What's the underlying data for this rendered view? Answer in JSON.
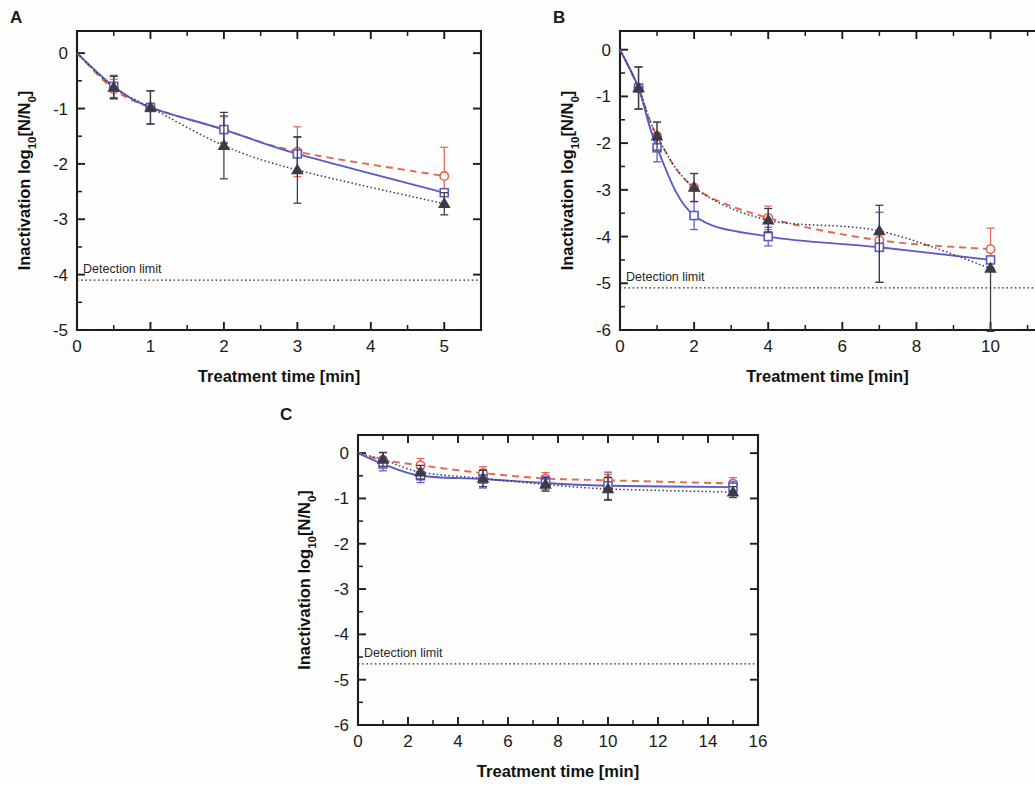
{
  "figure": {
    "background": "#fefefe",
    "axis_color": "#1c1c1c",
    "detection_limit_label": "Detection limit"
  },
  "colors": {
    "red": "#e2674f",
    "blue": "#5b5bc8",
    "black": "#3b3b48",
    "axis": "#1c1c1c",
    "text": "#1a1a1a"
  },
  "panels": {
    "a": {
      "label": "A",
      "xlabel": "Treatment time [min]",
      "ylabel_prefix": "Inactivation log",
      "ylabel_sub": "10",
      "ylabel_suffix": "[N/N",
      "ylabel_sub2": "0",
      "ylabel_end": "]",
      "xticks": [
        "0",
        "1",
        "2",
        "3",
        "4",
        "5"
      ],
      "yticks": [
        "0",
        "-1",
        "-2",
        "-3",
        "-4",
        "-5"
      ],
      "xlim": [
        0,
        5.5
      ],
      "ylim": [
        -5,
        0.4
      ],
      "detection_limit": -4.1,
      "detection_limit_label": "Detection limit"
    },
    "b": {
      "label": "B",
      "xlabel": "Treatment time [min]",
      "ylabel_prefix": "Inactivation log",
      "ylabel_sub": "10",
      "ylabel_suffix": "[N/N",
      "ylabel_sub2": "0",
      "ylabel_end": "]",
      "xticks": [
        "0",
        "2",
        "4",
        "6",
        "8",
        "10"
      ],
      "yticks": [
        "0",
        "-1",
        "-2",
        "-3",
        "-4",
        "-5",
        "-6"
      ],
      "xlim": [
        0,
        11.2
      ],
      "ylim": [
        -6,
        0.4
      ],
      "detection_limit": -5.1,
      "detection_limit_label": "Detection limit"
    },
    "c": {
      "label": "C",
      "xlabel": "Treatment time [min]",
      "ylabel_prefix": "Inactivation log",
      "ylabel_sub": "10",
      "ylabel_suffix": "[N/N",
      "ylabel_sub2": "0",
      "ylabel_end": "]",
      "xticks": [
        "0",
        "2",
        "4",
        "6",
        "8",
        "10",
        "12",
        "14",
        "16"
      ],
      "yticks": [
        "0",
        "-1",
        "-2",
        "-3",
        "-4",
        "-5",
        "-6"
      ],
      "xlim": [
        0,
        16
      ],
      "ylim": [
        -6,
        0.4
      ],
      "detection_limit": -4.65,
      "detection_limit_label": "Detection limit"
    }
  },
  "chart_data": [
    {
      "type": "line",
      "panel": "A",
      "title": "",
      "xlabel": "Treatment time [min]",
      "ylabel": "Inactivation log10[N/N0]",
      "xlim": [
        0,
        5.5
      ],
      "ylim": [
        -5,
        0.4
      ],
      "xticks": [
        0,
        1,
        2,
        3,
        4,
        5
      ],
      "yticks": [
        0,
        -1,
        -2,
        -3,
        -4,
        -5
      ],
      "grid": false,
      "legend": "none",
      "annotations": [
        {
          "text": "Detection limit",
          "y": -4.1,
          "line_style": "dotted"
        }
      ],
      "series": [
        {
          "name": "red-open-circle",
          "marker": "circle",
          "color": "#e2674f",
          "linestyle": "dashed",
          "x": [
            0,
            0.5,
            1,
            2,
            3,
            5
          ],
          "values": [
            0,
            -0.65,
            -0.98,
            -1.38,
            -1.78,
            -2.22
          ],
          "yerr_low": [
            0,
            0.18,
            0.3,
            0.23,
            0.45,
            0.52
          ],
          "yerr_high": [
            0,
            0.18,
            0.3,
            0.23,
            0.45,
            0.52
          ]
        },
        {
          "name": "blue-open-square",
          "marker": "square",
          "color": "#5b5bc8",
          "linestyle": "solid",
          "x": [
            0,
            0.5,
            1,
            2,
            3,
            5
          ],
          "values": [
            0,
            -0.6,
            -0.98,
            -1.38,
            -1.82,
            -2.52
          ],
          "yerr_low": [
            0,
            0.2,
            0.3,
            0.25,
            0.3,
            0.0
          ],
          "yerr_high": [
            0,
            0.2,
            0.3,
            0.25,
            0.3,
            0.0
          ]
        },
        {
          "name": "black-filled-triangle",
          "marker": "triangle",
          "color": "#3b3b48",
          "linestyle": "dotted",
          "x": [
            0,
            0.5,
            1,
            2,
            3,
            5
          ],
          "values": [
            0,
            -0.62,
            -0.98,
            -1.67,
            -2.11,
            -2.72
          ],
          "yerr_low": [
            0,
            0.2,
            0.3,
            0.6,
            0.6,
            0.2
          ],
          "yerr_high": [
            0,
            0.2,
            0.3,
            0.6,
            0.6,
            0.2
          ]
        }
      ]
    },
    {
      "type": "line",
      "panel": "B",
      "title": "",
      "xlabel": "Treatment time [min]",
      "ylabel": "Inactivation log10[N/N0]",
      "xlim": [
        0,
        11.2
      ],
      "ylim": [
        -6,
        0.4
      ],
      "xticks": [
        0,
        2,
        4,
        6,
        8,
        10
      ],
      "yticks": [
        0,
        -1,
        -2,
        -3,
        -4,
        -5,
        -6
      ],
      "grid": false,
      "legend": "none",
      "annotations": [
        {
          "text": "Detection limit",
          "y": -5.1,
          "line_style": "dotted"
        }
      ],
      "series": [
        {
          "name": "red-open-circle",
          "marker": "circle",
          "color": "#e2674f",
          "linestyle": "dashed",
          "x": [
            0,
            0.5,
            1,
            2,
            4,
            7,
            10
          ],
          "values": [
            0,
            -0.82,
            -1.85,
            -2.95,
            -3.6,
            -4.08,
            -4.27
          ],
          "yerr_low": [
            0,
            0.45,
            0.3,
            0.3,
            0.25,
            0.0,
            0.45
          ],
          "yerr_high": [
            0,
            0.45,
            0.3,
            0.3,
            0.25,
            0.0,
            0.45
          ]
        },
        {
          "name": "blue-open-square",
          "marker": "square",
          "color": "#5b5bc8",
          "linestyle": "solid",
          "x": [
            0,
            0.5,
            1,
            2,
            4,
            7,
            10
          ],
          "values": [
            0,
            -0.82,
            -2.1,
            -3.55,
            -4.0,
            -4.23,
            -4.5
          ],
          "yerr_low": [
            0,
            0.45,
            0.3,
            0.3,
            0.2,
            0.75,
            0.0
          ],
          "yerr_high": [
            0,
            0.45,
            0.3,
            0.3,
            0.2,
            0.75,
            0.0
          ]
        },
        {
          "name": "black-filled-triangle",
          "marker": "triangle",
          "color": "#3b3b48",
          "linestyle": "dotted",
          "x": [
            0,
            0.5,
            1,
            2,
            4,
            7,
            10
          ],
          "values": [
            0,
            -0.82,
            -1.85,
            -2.95,
            -3.65,
            -3.88,
            -4.68
          ],
          "yerr_low": [
            0,
            0.45,
            0.3,
            0.3,
            0.25,
            1.1,
            1.35
          ],
          "yerr_high": [
            0,
            0.45,
            0.3,
            0.3,
            0.25,
            0.55,
            0.0
          ]
        }
      ]
    },
    {
      "type": "line",
      "panel": "C",
      "title": "",
      "xlabel": "Treatment time [min]",
      "ylabel": "Inactivation log10[N/N0]",
      "xlim": [
        0,
        16
      ],
      "ylim": [
        -6,
        0.4
      ],
      "xticks": [
        0,
        2,
        4,
        6,
        8,
        10,
        12,
        14,
        16
      ],
      "yticks": [
        0,
        -1,
        -2,
        -3,
        -4,
        -5,
        -6
      ],
      "grid": false,
      "legend": "none",
      "annotations": [
        {
          "text": "Detection limit",
          "y": -4.65,
          "line_style": "dotted"
        }
      ],
      "series": [
        {
          "name": "red-open-circle",
          "marker": "circle",
          "color": "#e2674f",
          "linestyle": "dashed",
          "x": [
            0,
            1,
            2.5,
            5,
            7.5,
            10,
            15
          ],
          "values": [
            0,
            -0.15,
            -0.27,
            -0.44,
            -0.56,
            -0.6,
            -0.67
          ],
          "yerr_low": [
            0,
            0.17,
            0.15,
            0.14,
            0.13,
            0.13,
            0.13
          ],
          "yerr_high": [
            0,
            0.17,
            0.15,
            0.14,
            0.13,
            0.13,
            0.13
          ]
        },
        {
          "name": "blue-open-square",
          "marker": "square",
          "color": "#5b5bc8",
          "linestyle": "solid",
          "x": [
            0,
            1,
            2.5,
            5,
            7.5,
            10,
            15
          ],
          "values": [
            0,
            -0.24,
            -0.5,
            -0.57,
            -0.66,
            -0.72,
            -0.75
          ],
          "yerr_low": [
            0,
            0.15,
            0.15,
            0.2,
            0.15,
            0.3,
            0.13
          ],
          "yerr_high": [
            0,
            0.15,
            0.15,
            0.2,
            0.15,
            0.3,
            0.13
          ]
        },
        {
          "name": "black-filled-triangle",
          "marker": "triangle",
          "color": "#3b3b48",
          "linestyle": "dotted",
          "x": [
            0,
            1,
            2.5,
            5,
            7.5,
            10,
            15
          ],
          "values": [
            0,
            -0.14,
            -0.42,
            -0.56,
            -0.69,
            -0.79,
            -0.86
          ],
          "yerr_low": [
            0,
            0.15,
            0.15,
            0.18,
            0.15,
            0.25,
            0.12
          ],
          "yerr_high": [
            0,
            0.15,
            0.15,
            0.18,
            0.15,
            0.25,
            0.12
          ]
        }
      ]
    }
  ]
}
